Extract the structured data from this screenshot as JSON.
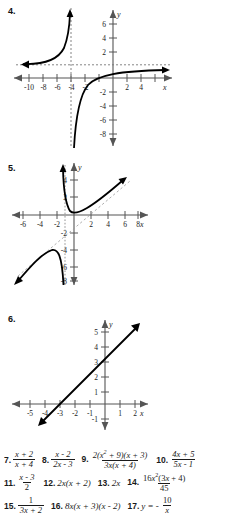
{
  "figures": [
    {
      "label": "4.",
      "type": "rational-function-graph",
      "x_ticks": [
        "-10",
        "-8",
        "-6",
        "-4",
        "-2",
        "2",
        "4"
      ],
      "y_ticks": [
        "6",
        "4",
        "2",
        "-2",
        "-4",
        "-6",
        "-8"
      ],
      "x_axis_label": "x",
      "y_axis_label": "y",
      "vertical_asymptote": "x = -4",
      "horizontal_asymptote": "y = 1"
    },
    {
      "label": "5.",
      "type": "rational-function-graph",
      "x_ticks": [
        "-6",
        "-4",
        "-2",
        "2",
        "4",
        "6",
        "8"
      ],
      "y_ticks": [
        "4",
        "2",
        "-2",
        "-4",
        "-6",
        "-8"
      ],
      "x_axis_label": "x",
      "y_axis_label": "y",
      "vertical_asymptote": "x = -0.5",
      "slant_asymptote": "y = x - 1"
    },
    {
      "label": "6.",
      "type": "line-graph",
      "x_ticks": [
        "-5",
        "-4",
        "-3",
        "-2",
        "-1",
        "1",
        "2"
      ],
      "y_ticks": [
        "5",
        "4",
        "3",
        "2",
        "1",
        "-1"
      ],
      "x_axis_label": "x",
      "y_axis_label": "y",
      "y_intercept": 3,
      "x_intercept": -3,
      "slope": 1
    }
  ],
  "answers": [
    [
      {
        "num": "7.",
        "kind": "fraction",
        "numerator": "x + 2",
        "denominator": "x + 4"
      },
      {
        "num": "8.",
        "kind": "fraction",
        "numerator": "x - 2",
        "denominator": "2x - 3"
      },
      {
        "num": "9.",
        "kind": "fraction",
        "numerator": "2(x2 + 9)(x + 3)",
        "denominator": "3x(x + 4)"
      },
      {
        "num": "10.",
        "kind": "fraction",
        "numerator": "4x + 5",
        "denominator": "5x - 1"
      }
    ],
    [
      {
        "num": "11.",
        "kind": "fraction",
        "numerator": "x - 3",
        "denominator": "2"
      },
      {
        "num": "12.",
        "kind": "inline",
        "expr": "2x(x + 2)"
      },
      {
        "num": "13.",
        "kind": "inline",
        "expr": "2x"
      },
      {
        "num": "14.",
        "kind": "fraction",
        "numerator": "16x2(3x + 4)",
        "denominator": "45"
      }
    ],
    [
      {
        "num": "15.",
        "kind": "fraction",
        "numerator": "1",
        "denominator": "3x + 2"
      },
      {
        "num": "16.",
        "kind": "inline",
        "expr": "8x(x + 3)(x - 2)"
      },
      {
        "num": "17.",
        "kind": "fraction-signed",
        "prefix": "y = -",
        "numerator": "10",
        "denominator": "x"
      }
    ]
  ],
  "colors": {
    "ink": "#1a1a1a",
    "axis": "#555555",
    "curve": "#000000",
    "asymptote": "#777777"
  }
}
